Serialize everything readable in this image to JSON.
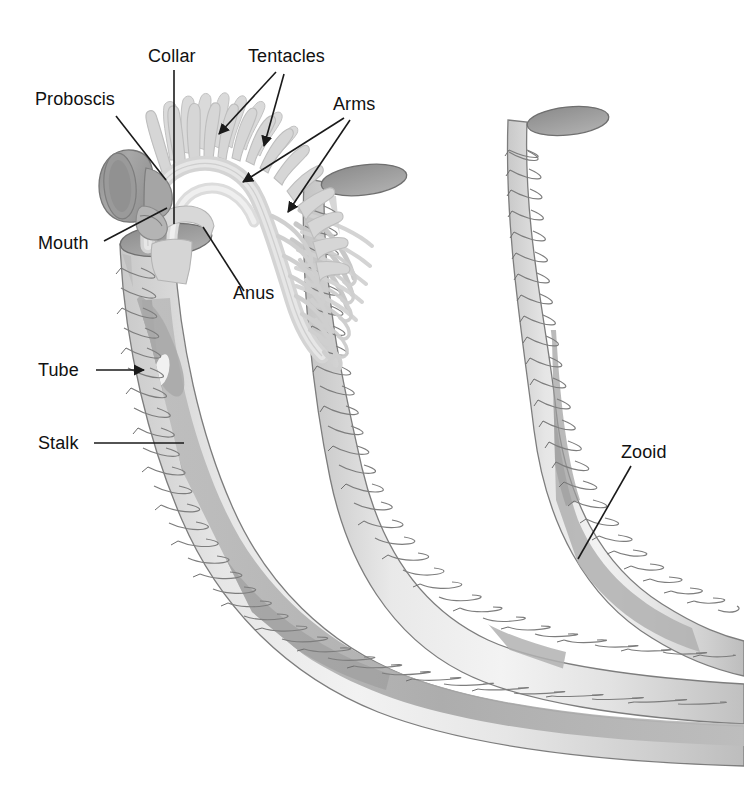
{
  "figure": {
    "kind": "anatomical-diagram",
    "background_color": "#ffffff",
    "width": 744,
    "height": 793
  },
  "palette": {
    "background": "#ffffff",
    "label_text": "#111111",
    "leader_line": "#1a1a1a",
    "tube_light": "#ececec",
    "tube_mid": "#dedede",
    "tube_shadow": "#c9c9c9",
    "tube_outline": "#808080",
    "stalk_band": "#b4b4b4",
    "stalk_band_dark": "#a0a0a0",
    "opening_fill": "#9a9a9a",
    "opening_rim": "#6f6f6f",
    "tentacle": "#d6d6d6",
    "tentacle_outline": "#b9b9b9",
    "arm_fill": "#dcdcdc",
    "arm_outline": "#b0b0b0",
    "proboscis_fill": "#9d9d9d",
    "proboscis_dark": "#8a8a8a",
    "proboscis_outline": "#7a7a7a",
    "collar_fill": "#cfcfcf"
  },
  "labels": [
    {
      "id": "proboscis",
      "text": "Proboscis",
      "text_x": 35,
      "text_y": 105,
      "anchor": "start",
      "leader": "M 116 116 L 166 180",
      "arrowhead": false,
      "description": "Bell-shaped anterior shield of the zooid"
    },
    {
      "id": "collar",
      "text": "Collar",
      "text_x": 148,
      "text_y": 62,
      "anchor": "start",
      "leader": "M 174 70 L 174 224",
      "arrowhead": false,
      "description": "Collar region bearing the arms"
    },
    {
      "id": "tentacles",
      "text": "Tentacles",
      "text_x": 248,
      "text_y": 62,
      "anchor": "start",
      "leader": "M 276 72 L 219 134 M 284 74 L 264 144",
      "arrowhead": true,
      "description": "Ciliated tentacles borne on the arms"
    },
    {
      "id": "arms",
      "text": "Arms",
      "text_x": 333,
      "text_y": 110,
      "anchor": "start",
      "leader": "M 344 118 L 243 182 M 350 120 L 288 212",
      "arrowhead": true,
      "description": "Paired arms supporting the tentacles"
    },
    {
      "id": "mouth",
      "text": "Mouth",
      "text_x": 38,
      "text_y": 249,
      "anchor": "start",
      "leader": "M 104 241 L 167 208",
      "arrowhead": false,
      "description": "Mouth between proboscis and collar"
    },
    {
      "id": "anus",
      "text": "Anus",
      "text_x": 233,
      "text_y": 299,
      "anchor": "start",
      "leader": "M 244 291 L 203 227",
      "arrowhead": false,
      "description": "Anus opening on the dorsal collar"
    },
    {
      "id": "tube",
      "text": "Tube",
      "text_x": 38,
      "text_y": 376,
      "anchor": "start",
      "leader": "M 96 370 L 144 370",
      "arrowhead": true,
      "description": "Secreted coenecium tube housing the zooid"
    },
    {
      "id": "stalk",
      "text": "Stalk",
      "text_x": 38,
      "text_y": 449,
      "anchor": "start",
      "leader": "M 94 443 L 184 443",
      "arrowhead": false,
      "description": "Contractile stalk connecting the zooid to the colony"
    },
    {
      "id": "zooid",
      "text": "Zooid",
      "text_x": 621,
      "text_y": 458,
      "anchor": "start",
      "leader": "M 631 466 L 578 559",
      "arrowhead": false,
      "description": "An individual colony member within its tube"
    }
  ],
  "structures": {
    "tube_count": 3,
    "tube_ring_counts": [
      26,
      30,
      24
    ],
    "tentacle_count": 22,
    "openings": [
      "tube-1-opening",
      "tube-2-opening",
      "tube-3-opening"
    ]
  }
}
